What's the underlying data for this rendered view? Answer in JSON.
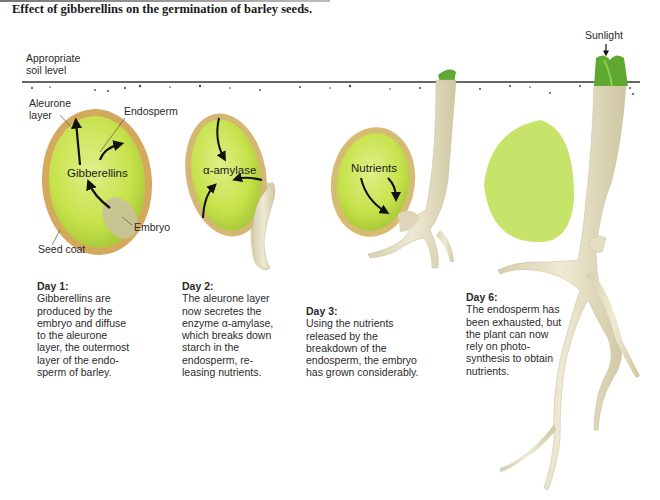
{
  "title": "Effect of gibberellins on the germination of barley seeds.",
  "labels": {
    "soil_level": [
      "Appropriate",
      "soil level"
    ],
    "aleurone": [
      "Aleurone",
      "layer"
    ],
    "endosperm": "Endosperm",
    "gibberellins": "Gibberellins",
    "embryo": "Embryo",
    "seed_coat": "Seed coat",
    "alpha_amylase": "α-amylase",
    "nutrients": "Nutrients",
    "sunlight": "Sunlight"
  },
  "days": [
    {
      "heading": "Day 1:",
      "lines": [
        "Gibberellins are",
        "produced by the",
        "embryo and diffuse",
        "to the aleurone",
        "layer, the outermost",
        "layer of the endo-",
        "sperm of barley."
      ]
    },
    {
      "heading": "Day 2:",
      "lines": [
        "The aleurone layer",
        "now secretes the",
        "enzyme α-amylase,",
        "which breaks down",
        "starch in the",
        "endosperm, re-",
        "leasing nutrients."
      ]
    },
    {
      "heading": "Day 3:",
      "lines": [
        "Using the nutrients",
        "released by the",
        "breakdown of the",
        "endosperm, the embryo",
        "has grown considerably."
      ]
    },
    {
      "heading": "Day 6:",
      "lines": [
        "The endosperm has",
        "been exhausted, but",
        "the plant can now",
        "rely on photo-",
        "synthesis to obtain",
        "nutrients."
      ]
    }
  ],
  "colors": {
    "endosperm": "#c9e64a",
    "aleurone": "#d9b46a",
    "root": "#e2dcc0",
    "leaf": "#5fa832",
    "soil_line": "#333333"
  }
}
